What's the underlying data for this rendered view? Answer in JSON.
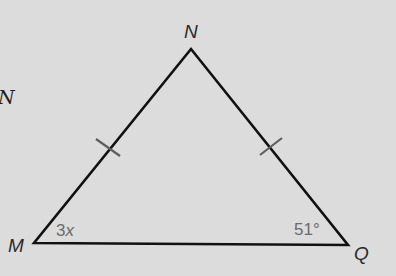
{
  "figure": {
    "cut_off_label": "N",
    "triangle": {
      "vertices": {
        "N": {
          "label": "N"
        },
        "M": {
          "label": "M"
        },
        "Q": {
          "label": "Q"
        }
      },
      "angles": {
        "M": {
          "label_number": "3",
          "label_var": "x"
        },
        "Q": {
          "label": "51°"
        }
      },
      "congruent_sides": [
        "MN",
        "NQ"
      ],
      "tick_marks_per_side": 1
    },
    "colors": {
      "background": "#dcdcdc",
      "line": "#111111",
      "tick": "#5e5e5e",
      "angle_text": "#6b6b6b",
      "vertex_text": "#2a2a2a"
    }
  }
}
